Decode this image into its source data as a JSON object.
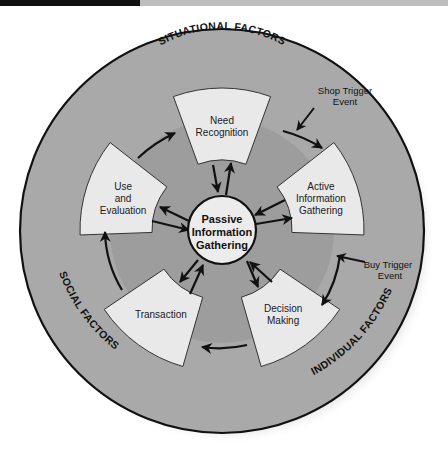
{
  "header_bar": {
    "left_color": "#111111",
    "right_color": "#bdbdbd"
  },
  "diagram": {
    "colors": {
      "outer_ring": "#a9a9a9",
      "inner_area": "#9d9d9d",
      "box_fill": "#e9e9e9",
      "center_fill": "#ececec",
      "stroke": "#111111"
    },
    "outer_factors": {
      "top": "SITUATIONAL FACTORS",
      "left": "SOCIAL FACTORS",
      "right": "INDIVIDUAL FACTORS"
    },
    "center": {
      "line1": "Passive",
      "line2": "Information",
      "line3": "Gathering"
    },
    "stages": [
      {
        "id": "need-recognition",
        "lines": [
          "Need",
          "Recognition"
        ]
      },
      {
        "id": "active-information-gathering",
        "lines": [
          "Active",
          "Information",
          "Gathering"
        ]
      },
      {
        "id": "decision-making",
        "lines": [
          "Decision",
          "Making"
        ]
      },
      {
        "id": "transaction",
        "lines": [
          "Transaction"
        ]
      },
      {
        "id": "use-and-evaluation",
        "lines": [
          "Use",
          "and",
          "Evaluation"
        ]
      }
    ],
    "triggers": {
      "shop": {
        "line1": "Shop Trigger",
        "line2": "Event"
      },
      "buy": {
        "line1": "Buy Trigger",
        "line2": "Event"
      }
    }
  }
}
